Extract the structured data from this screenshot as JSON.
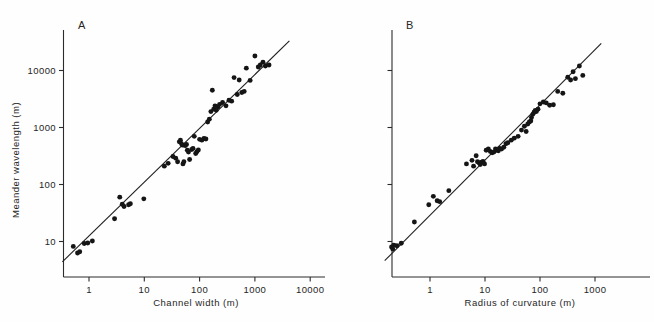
{
  "figure": {
    "background": "#fefefe",
    "ink_color": "#1f1f1f"
  },
  "chart_data": [
    {
      "type": "scatter",
      "panel": "A",
      "title": "",
      "xlabel": "Channel width (m)",
      "ylabel": "Meander wavelength (m)",
      "xscale": "log",
      "yscale": "log",
      "xticks": [
        1,
        10,
        100,
        1000,
        10000
      ],
      "xtick_labels": [
        "1",
        "10",
        "100",
        "1000",
        "10000"
      ],
      "yticks": [
        10,
        100,
        1000,
        10000
      ],
      "ytick_labels": [
        "10",
        "100",
        "1000",
        "10000"
      ],
      "xlim": [
        0.32,
        26000
      ],
      "ylim": [
        4.2,
        42000
      ],
      "grid": false,
      "legend": false,
      "fit_line": {
        "label": "regression line",
        "x": [
          0.33,
          4200
        ],
        "y": [
          4.4,
          33000
        ]
      },
      "points": [
        [
          0.52,
          8.2
        ],
        [
          0.62,
          6.3
        ],
        [
          0.68,
          6.6
        ],
        [
          0.82,
          9.2
        ],
        [
          0.95,
          9.4
        ],
        [
          1.15,
          10.2
        ],
        [
          2.9,
          25.0
        ],
        [
          3.6,
          60.0
        ],
        [
          4.0,
          45.0
        ],
        [
          4.3,
          41.0
        ],
        [
          5.2,
          44.0
        ],
        [
          5.6,
          46.0
        ],
        [
          9.8,
          56.0
        ],
        [
          23.0,
          210.0
        ],
        [
          27.0,
          235.0
        ],
        [
          33.0,
          310.0
        ],
        [
          37.0,
          290.0
        ],
        [
          40.0,
          250.0
        ],
        [
          43.0,
          560.0
        ],
        [
          45.0,
          600.0
        ],
        [
          47.0,
          520.0
        ],
        [
          49.0,
          490.0
        ],
        [
          50.0,
          230.0
        ],
        [
          52.0,
          250.0
        ],
        [
          55.0,
          480.0
        ],
        [
          58.0,
          505.0
        ],
        [
          60.0,
          400.0
        ],
        [
          63.0,
          370.0
        ],
        [
          66.0,
          275.0
        ],
        [
          72.0,
          410.0
        ],
        [
          76.0,
          430.0
        ],
        [
          80.0,
          700.0
        ],
        [
          85.0,
          350.0
        ],
        [
          90.0,
          380.0
        ],
        [
          95.0,
          405.0
        ],
        [
          100.0,
          620.0
        ],
        [
          110.0,
          600.0
        ],
        [
          120.0,
          640.0
        ],
        [
          130.0,
          630.0
        ],
        [
          140.0,
          1250.0
        ],
        [
          150.0,
          1400.0
        ],
        [
          160.0,
          1900.0
        ],
        [
          170.0,
          4500.0
        ],
        [
          180.0,
          2100.0
        ],
        [
          190.0,
          2400.0
        ],
        [
          200.0,
          2000.0
        ],
        [
          215.0,
          2300.0
        ],
        [
          230.0,
          2550.0
        ],
        [
          260.0,
          2750.0
        ],
        [
          300.0,
          2400.0
        ],
        [
          340.0,
          3000.0
        ],
        [
          380.0,
          2900.0
        ],
        [
          420.0,
          7500.0
        ],
        [
          480.0,
          3800.0
        ],
        [
          520.0,
          6800.0
        ],
        [
          580.0,
          4100.0
        ],
        [
          640.0,
          4300.0
        ],
        [
          700.0,
          11000.0
        ],
        [
          820.0,
          6700.0
        ],
        [
          1000.0,
          18000.0
        ],
        [
          1150.0,
          11500.0
        ],
        [
          1250.0,
          12500.0
        ],
        [
          1400.0,
          14000.0
        ],
        [
          1550.0,
          12000.0
        ],
        [
          1800.0,
          12500.0
        ]
      ]
    },
    {
      "type": "scatter",
      "panel": "B",
      "title": "",
      "xlabel": "Radius of curvature (m)",
      "ylabel": "Meander wavelength (m)",
      "xscale": "log",
      "yscale": "log",
      "xticks": [
        1,
        10,
        100,
        1000
      ],
      "xtick_labels": [
        "1",
        "10",
        "100",
        "1000"
      ],
      "yticks": [
        10,
        100,
        1000,
        10000
      ],
      "ytick_labels": [
        "",
        "",
        "",
        ""
      ],
      "xlim": [
        0.13,
        4200
      ],
      "ylim": [
        4.2,
        42000
      ],
      "grid": false,
      "legend": false,
      "fit_line": {
        "label": "regression line",
        "x": [
          0.15,
          1300
        ],
        "y": [
          4.6,
          30000
        ]
      },
      "points": [
        [
          0.2,
          8.0
        ],
        [
          0.21,
          7.4
        ],
        [
          0.22,
          8.6
        ],
        [
          0.25,
          8.4
        ],
        [
          0.3,
          9.3
        ],
        [
          0.52,
          22.0
        ],
        [
          0.95,
          44.0
        ],
        [
          1.15,
          62.0
        ],
        [
          1.35,
          52.0
        ],
        [
          1.5,
          50.0
        ],
        [
          2.2,
          78.0
        ],
        [
          4.6,
          230.0
        ],
        [
          5.8,
          265.0
        ],
        [
          6.2,
          210.0
        ],
        [
          6.9,
          320.0
        ],
        [
          7.3,
          250.0
        ],
        [
          7.8,
          240.0
        ],
        [
          8.2,
          225.0
        ],
        [
          8.6,
          245.0
        ],
        [
          9.2,
          255.0
        ],
        [
          9.8,
          230.0
        ],
        [
          10.5,
          400.0
        ],
        [
          11.5,
          420.0
        ],
        [
          12.5,
          380.0
        ],
        [
          13.5,
          360.0
        ],
        [
          14.5,
          370.0
        ],
        [
          15.5,
          420.0
        ],
        [
          16.5,
          400.0
        ],
        [
          17.5,
          390.0
        ],
        [
          18.5,
          430.0
        ],
        [
          20.0,
          420.0
        ],
        [
          22.0,
          450.0
        ],
        [
          24.0,
          520.0
        ],
        [
          26.0,
          540.0
        ],
        [
          30.0,
          600.0
        ],
        [
          34.0,
          650.0
        ],
        [
          40.0,
          700.0
        ],
        [
          46.0,
          900.0
        ],
        [
          52.0,
          1050.0
        ],
        [
          56.0,
          850.0
        ],
        [
          60.0,
          1150.0
        ],
        [
          64.0,
          1250.0
        ],
        [
          68.0,
          1300.0
        ],
        [
          70.0,
          1500.0
        ],
        [
          74.0,
          1700.0
        ],
        [
          78.0,
          1850.0
        ],
        [
          82.0,
          2000.0
        ],
        [
          86.0,
          1900.0
        ],
        [
          92.0,
          2100.0
        ],
        [
          100.0,
          2600.0
        ],
        [
          115.0,
          2800.0
        ],
        [
          130.0,
          2700.0
        ],
        [
          150.0,
          2450.0
        ],
        [
          175.0,
          2500.0
        ],
        [
          210.0,
          4300.0
        ],
        [
          260.0,
          4000.0
        ],
        [
          320.0,
          7600.0
        ],
        [
          360.0,
          6800.0
        ],
        [
          400.0,
          9500.0
        ],
        [
          440.0,
          7200.0
        ],
        [
          520.0,
          12000.0
        ],
        [
          600.0,
          8200.0
        ]
      ]
    }
  ]
}
